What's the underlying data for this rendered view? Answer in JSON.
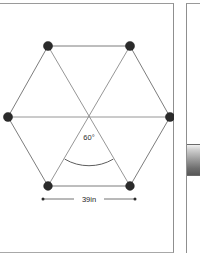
{
  "figure": {
    "title_text": "",
    "shape_name": "hexagon",
    "angle": {
      "label": "60°",
      "value": 60,
      "unit": "degrees",
      "position": {
        "x": 89,
        "y": 133
      }
    },
    "dimension": {
      "label": "39in",
      "value": 39,
      "unit": "in",
      "measures": "bottom-edge-length",
      "position": {
        "x": 89,
        "y": 195
      }
    },
    "center": {
      "x": 89,
      "y": 113
    },
    "vertices": [
      {
        "name": "top-left",
        "x": 48,
        "y": 42
      },
      {
        "name": "top-right",
        "x": 130,
        "y": 42
      },
      {
        "name": "right",
        "x": 170,
        "y": 113
      },
      {
        "name": "bottom-right",
        "x": 130,
        "y": 182
      },
      {
        "name": "bottom-left",
        "x": 48,
        "y": 182
      },
      {
        "name": "left",
        "x": 8,
        "y": 113
      }
    ],
    "dimension_line": {
      "x1": 43,
      "x2": 135,
      "y": 195
    },
    "colors": {
      "vertex": "#2b2b2b",
      "edge": "#7d7d7d",
      "diagonal": "#8a8a8a",
      "annotation": "#2d2d2d",
      "panel_border": "#8f8f8f",
      "background": "#ffffff"
    }
  },
  "side_panel": {
    "visible": true,
    "swatch_label": "",
    "swatch_colors": {
      "top": "#f2f2f2",
      "bottom": "#585858"
    }
  }
}
